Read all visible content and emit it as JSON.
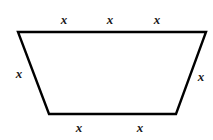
{
  "figure": {
    "shape_type": "trapezoid",
    "stroke_color": "#000000",
    "fill_color": "#ffffff",
    "stroke_width": 2.4,
    "canvas": {
      "width": 213,
      "height": 140
    }
  },
  "vertices": {
    "top_left": {
      "x": 18,
      "y": 32
    },
    "top_right": {
      "x": 206,
      "y": 32
    },
    "bottom_right": {
      "x": 176,
      "y": 114
    },
    "bottom_left": {
      "x": 49,
      "y": 114
    }
  },
  "labels": {
    "top": [
      {
        "text": "x",
        "x": 64,
        "y": 20
      },
      {
        "text": "x",
        "x": 110,
        "y": 20
      },
      {
        "text": "x",
        "x": 157,
        "y": 20
      }
    ],
    "bottom": [
      {
        "text": "x",
        "x": 79,
        "y": 128
      },
      {
        "text": "x",
        "x": 140,
        "y": 128
      }
    ],
    "left": [
      {
        "text": "x",
        "x": 19,
        "y": 74
      }
    ],
    "right": [
      {
        "text": "x",
        "x": 201,
        "y": 77
      }
    ]
  },
  "side_lengths": {
    "top_label_count": 3,
    "bottom_label_count": 2,
    "left_label_count": 1,
    "right_label_count": 1,
    "top_expression": "3x",
    "bottom_expression": "2x",
    "leg_expression": "x",
    "perimeter_expression": "7x"
  }
}
